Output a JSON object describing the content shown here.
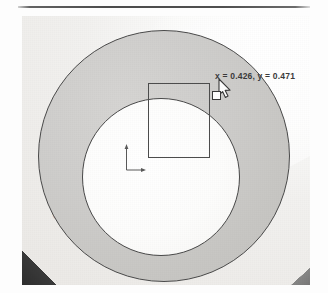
{
  "page": {
    "background_color": "#fdfdfd",
    "divider": {
      "name": "horizontal-rule",
      "color": "#3c3c3c"
    }
  },
  "figure": {
    "caption": "",
    "photo": {
      "description": "scanned screenshot of a CAD measurement view showing an annular washer part",
      "background_color": "#f2f1ef"
    },
    "part": {
      "outer_disc_color": "#cecdcb",
      "inner_hole_color": "#ffffff",
      "outline_color": "#4a4a4a"
    },
    "selection_rectangle": {
      "name": "selection-rectangle",
      "stroke_color": "#4d4d4d"
    },
    "cursor": {
      "name": "resize-cursor",
      "type": "resize-arrow-with-handle",
      "color": "#3a3a3a"
    },
    "coordinate_readout": {
      "text": "x = 0.426, y = 0.471",
      "x_label": "x",
      "x_value": "0.426",
      "y_label": "y",
      "y_value": "0.471",
      "color": "#3b3b3b"
    },
    "axis_marker": {
      "name": "origin-axis-marker",
      "x_axis_label": "",
      "y_axis_label": "",
      "color": "#555555"
    },
    "bleed_through": {
      "line1": "m e  u  tast",
      "line2": "ol s  nirmac",
      "color": "#c47878"
    }
  }
}
